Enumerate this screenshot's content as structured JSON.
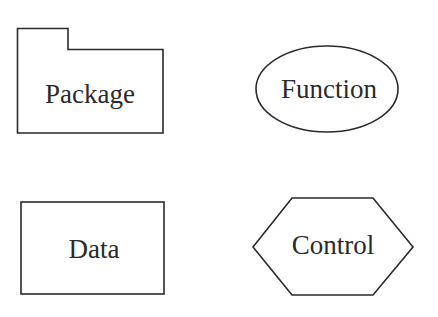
{
  "diagram": {
    "canvas": {
      "width": 438,
      "height": 317,
      "background": "#ffffff"
    },
    "stroke_color": "#2a2a2a",
    "text_color": "#2a2a2a",
    "shapes": [
      {
        "id": "package",
        "type": "folder",
        "label": "Package"
      },
      {
        "id": "function",
        "type": "ellipse",
        "label": "Function"
      },
      {
        "id": "data",
        "type": "rectangle",
        "label": "Data"
      },
      {
        "id": "control",
        "type": "hexagon",
        "label": "Control"
      }
    ]
  }
}
